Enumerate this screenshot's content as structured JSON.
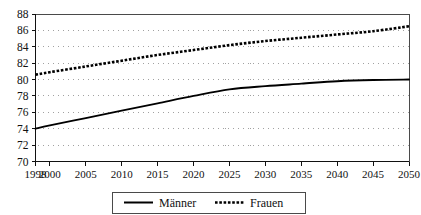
{
  "title": {
    "text": "",
    "visible_partial": true
  },
  "legend": {
    "position": "bottom-center",
    "entries": [
      {
        "label": "Männer",
        "style": "solid",
        "color": "#000000"
      },
      {
        "label": "Frauen",
        "style": "dotted",
        "color": "#000000"
      }
    ]
  },
  "axes": {
    "y_ticks": [
      "70",
      "72",
      "74",
      "76",
      "78",
      "80",
      "82",
      "84",
      "86",
      "88"
    ],
    "x_ticks": [
      "1998",
      "2000",
      "2005",
      "2010",
      "2015",
      "2020",
      "2025",
      "2030",
      "2035",
      "2040",
      "2045",
      "2050"
    ]
  },
  "chart_data": {
    "type": "line",
    "title": "",
    "subtitle": "",
    "xlabel": "",
    "ylabel": "",
    "x": [
      1998,
      2000,
      2005,
      2010,
      2015,
      2020,
      2025,
      2030,
      2035,
      2040,
      2045,
      2050
    ],
    "x_positions": [
      0,
      1,
      2,
      3,
      4,
      5,
      6,
      7,
      8,
      9,
      10,
      11
    ],
    "xlim": [
      1998,
      2050
    ],
    "ylim": [
      70,
      88
    ],
    "y_tick_step": 2,
    "grid": true,
    "grid_axis": "y",
    "legend_position": "bottom",
    "series": [
      {
        "name": "Männer",
        "style": "solid",
        "color": "#000000",
        "values": [
          74.0,
          74.4,
          75.3,
          76.2,
          77.1,
          78.0,
          78.8,
          79.2,
          79.5,
          79.8,
          79.95,
          80.0
        ]
      },
      {
        "name": "Frauen",
        "style": "dotted",
        "color": "#000000",
        "values": [
          80.6,
          80.9,
          81.6,
          82.3,
          83.0,
          83.6,
          84.2,
          84.7,
          85.1,
          85.5,
          85.9,
          86.5
        ]
      }
    ]
  }
}
